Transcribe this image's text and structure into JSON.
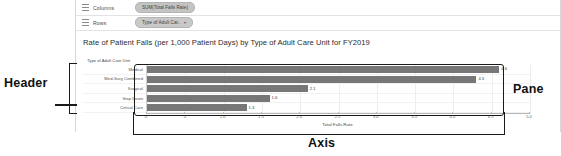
{
  "shelves": [
    {
      "name": "columns",
      "label": "Columns",
      "grip_icon": "grip-icon",
      "pill": {
        "text": "SUM(Total Falls Rate)",
        "kind": "measure",
        "caret": ""
      }
    },
    {
      "name": "rows",
      "label": "Rows",
      "grip_icon": "grip-icon",
      "pill": {
        "text": "Type of Adult Car..",
        "kind": "dimension",
        "caret": "▾"
      }
    }
  ],
  "viz": {
    "title": "Rate of Patient Falls (per 1,000 Patient Days) by Type of Adult Care Unit for FY2019",
    "field_caption": "Type of Adult Care Unit",
    "axis_title": "Total Falls Rate"
  },
  "annotations": {
    "header": "Header",
    "pane": "Pane",
    "axis": "Axis"
  },
  "chart_data": {
    "type": "bar",
    "orientation": "horizontal",
    "title": "Rate of Patient Falls (per 1,000 Patient Days) by Type of Adult Care Unit for FY2019",
    "xlabel": "Total Falls Rate",
    "ylabel": "Type of Adult Care Unit",
    "categories": [
      "Medical",
      "Med-Surg Combined",
      "Surgical",
      "Step Down",
      "Critical Care"
    ],
    "values": [
      4.6,
      4.3,
      2.1,
      1.6,
      1.3
    ],
    "value_labels": [
      "4.6",
      "4.3",
      "2.1",
      "1.6",
      "1.3"
    ],
    "xlim": [
      0,
      5.0
    ],
    "xticks": [
      0,
      0.5,
      1.0,
      1.5,
      2.0,
      2.5,
      3.0,
      3.5,
      4.0,
      4.5,
      5.0
    ],
    "xtick_labels": [
      "0",
      ".5",
      "1.0",
      "1.5",
      "2.0",
      "2.5",
      "3.0",
      "3.5",
      "4.0",
      "4.5",
      "5.0"
    ],
    "grid": true,
    "legend": "none",
    "bar_color": "#777777"
  }
}
